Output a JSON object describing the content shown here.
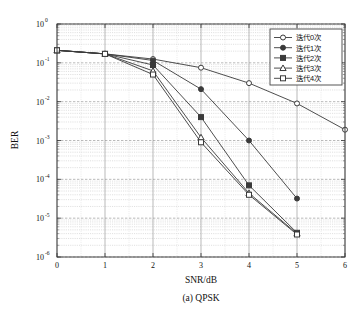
{
  "figure": {
    "caption": "(a) QPSK"
  },
  "chart_data": {
    "type": "line",
    "title": "",
    "subtitle": "",
    "caption": "(a) QPSK",
    "xlabel": "SNR/dB",
    "ylabel": "BER",
    "xlim": [
      0,
      6
    ],
    "ylim": [
      1e-06,
      1
    ],
    "yscale": "log",
    "xscale": "linear",
    "xticks": [
      "0",
      "1",
      "2",
      "3",
      "4",
      "5",
      "6"
    ],
    "yticks": [
      "10",
      "10",
      "10",
      "10",
      "10",
      "10",
      "10"
    ],
    "ytick_exponents": [
      "0",
      "-1",
      "-2",
      "-3",
      "-4",
      "-5",
      "-6"
    ],
    "grid": true,
    "minor_grid": true,
    "legend_position": "upper right",
    "series": [
      {
        "name": "迭代0次",
        "marker": "circle-open",
        "color": "#3a3a3a",
        "x": [
          0,
          1,
          2,
          3,
          4,
          5,
          6
        ],
        "y": [
          0.21,
          0.17,
          0.125,
          0.075,
          0.03,
          0.009,
          0.0019
        ]
      },
      {
        "name": "迭代1次",
        "marker": "circle-filled",
        "color": "#3a3a3a",
        "x": [
          0,
          1,
          2,
          3,
          4,
          5
        ],
        "y": [
          0.21,
          0.17,
          0.115,
          0.021,
          0.001,
          3.2e-05
        ]
      },
      {
        "name": "迭代2次",
        "marker": "square-filled",
        "color": "#3a3a3a",
        "x": [
          0,
          1,
          2,
          3,
          4,
          5
        ],
        "y": [
          0.21,
          0.17,
          0.088,
          0.004,
          7e-05,
          4.2e-06
        ]
      },
      {
        "name": "迭代3次",
        "marker": "triangle-open",
        "color": "#3a3a3a",
        "x": [
          0,
          1,
          2,
          3,
          4,
          5
        ],
        "y": [
          0.21,
          0.17,
          0.062,
          0.0012,
          4.4e-05,
          4e-06
        ]
      },
      {
        "name": "迭代4次",
        "marker": "square-open",
        "color": "#3a3a3a",
        "x": [
          0,
          1,
          2,
          3,
          4,
          5
        ],
        "y": [
          0.21,
          0.17,
          0.05,
          0.0009,
          4e-05,
          3.8e-06
        ]
      }
    ]
  }
}
